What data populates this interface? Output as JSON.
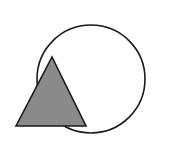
{
  "figure": {
    "background_color": "#ffffff",
    "width": 184,
    "height": 155
  },
  "chart_data": {
    "type": "diagram",
    "title": "",
    "shapes": [
      {
        "name": "circle",
        "kind": "circle",
        "cx": 91,
        "cy": 79,
        "r": 54,
        "fill": "none",
        "stroke": "#1a1a1a",
        "stroke_width": 1.6,
        "z_order": 1
      },
      {
        "name": "triangle",
        "kind": "triangle",
        "points": "52,57 86,126 16,126",
        "apex": [
          52,
          57
        ],
        "base_left": [
          16,
          126
        ],
        "base_right": [
          86,
          126
        ],
        "fill": "#8a8a8a",
        "stroke": "#1a1a1a",
        "stroke_width": 1.6,
        "z_order": 2
      }
    ]
  }
}
